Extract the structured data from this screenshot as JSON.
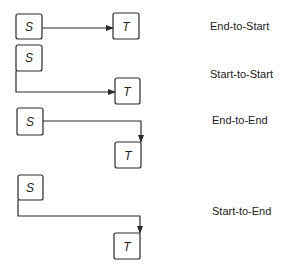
{
  "diagram": {
    "relationships": [
      {
        "name": "End-to-Start",
        "source": "S",
        "target": "T"
      },
      {
        "name": "Start-to-Start",
        "source": "S",
        "target": "T"
      },
      {
        "name": "End-to-End",
        "source": "S",
        "target": "T"
      },
      {
        "name": "Start-to-End",
        "source": "S",
        "target": "T"
      }
    ],
    "colors": {
      "stroke": "#2a2a2a",
      "background": "#ffffff"
    }
  }
}
